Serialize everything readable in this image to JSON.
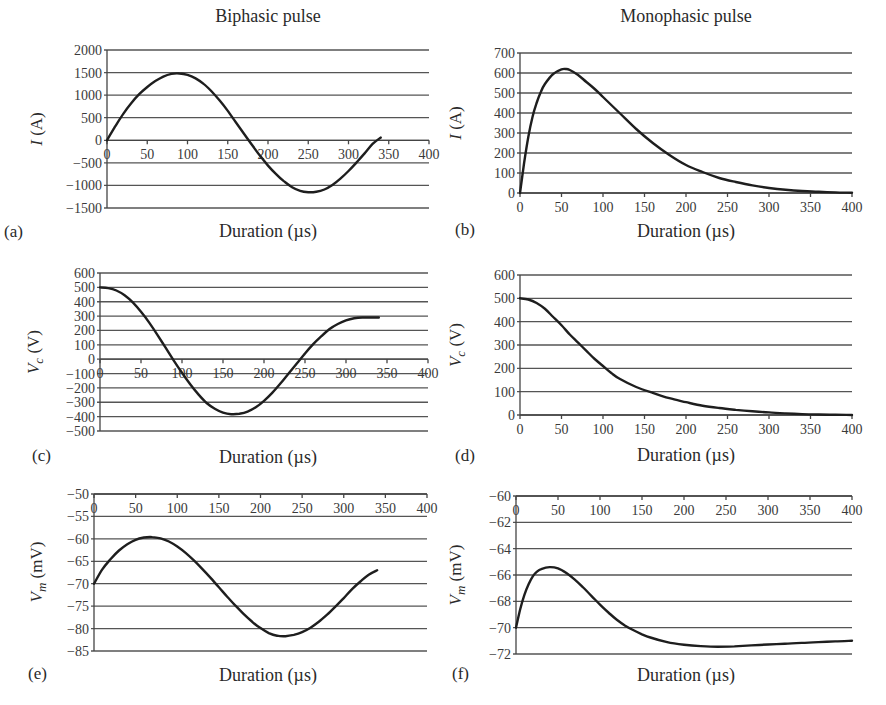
{
  "figure": {
    "column_titles": [
      "Biphasic pulse",
      "Monophasic pulse"
    ]
  },
  "chart_data": [
    {
      "id": "a",
      "panel_label": "(a)",
      "type": "line",
      "title": "Biphasic pulse",
      "xlabel": "Duration (µs)",
      "ylabel": "I (A)",
      "ylabel_parts": {
        "symbol": "I",
        "unit": "(A)",
        "subscript": ""
      },
      "xlim": [
        0,
        400
      ],
      "ylim": [
        -1500,
        2000
      ],
      "xticks": [
        0,
        50,
        100,
        150,
        200,
        250,
        300,
        350,
        400
      ],
      "yticks": [
        2000,
        1500,
        1000,
        500,
        0,
        -500,
        -1000,
        -1500
      ],
      "xtick_labels_at_y": 0,
      "grid": true,
      "legend": null,
      "series": [
        {
          "name": "I",
          "x": [
            0,
            10,
            20,
            30,
            40,
            50,
            60,
            70,
            80,
            90,
            100,
            110,
            120,
            130,
            140,
            150,
            160,
            170,
            180,
            190,
            200,
            210,
            220,
            230,
            240,
            250,
            260,
            270,
            280,
            290,
            300,
            310,
            320,
            330,
            340
          ],
          "values": [
            0,
            300,
            580,
            820,
            1020,
            1180,
            1310,
            1410,
            1470,
            1480,
            1450,
            1370,
            1250,
            1080,
            880,
            650,
            400,
            150,
            -100,
            -340,
            -560,
            -750,
            -910,
            -1040,
            -1120,
            -1150,
            -1140,
            -1090,
            -990,
            -850,
            -680,
            -490,
            -290,
            -80,
            60
          ]
        }
      ]
    },
    {
      "id": "b",
      "panel_label": "(b)",
      "type": "line",
      "title": "Monophasic pulse",
      "xlabel": "Duration (µs)",
      "ylabel": "I (A)",
      "ylabel_parts": {
        "symbol": "I",
        "unit": "(A)",
        "subscript": ""
      },
      "xlim": [
        0,
        400
      ],
      "ylim": [
        0,
        700
      ],
      "xticks": [
        0,
        50,
        100,
        150,
        200,
        250,
        300,
        350,
        400
      ],
      "yticks": [
        700,
        600,
        500,
        400,
        300,
        200,
        100,
        0
      ],
      "xtick_labels_at_y": 0,
      "grid": true,
      "legend": null,
      "series": [
        {
          "name": "I",
          "x": [
            0,
            5,
            10,
            15,
            20,
            25,
            30,
            40,
            50,
            55,
            60,
            70,
            80,
            90,
            100,
            120,
            140,
            160,
            180,
            200,
            220,
            240,
            260,
            280,
            300,
            320,
            340,
            360,
            380,
            400
          ],
          "values": [
            0,
            150,
            280,
            380,
            450,
            505,
            545,
            595,
            618,
            620,
            615,
            590,
            555,
            520,
            480,
            400,
            320,
            250,
            190,
            140,
            105,
            75,
            55,
            38,
            25,
            16,
            10,
            6,
            3,
            1
          ]
        }
      ]
    },
    {
      "id": "c",
      "panel_label": "(c)",
      "type": "line",
      "title": "",
      "xlabel": "Duration (µs)",
      "ylabel": "Vc (V)",
      "ylabel_parts": {
        "symbol": "V",
        "unit": "(V)",
        "subscript": "c"
      },
      "xlim": [
        0,
        400
      ],
      "ylim": [
        -500,
        600
      ],
      "xticks": [
        0,
        50,
        100,
        150,
        200,
        250,
        300,
        350,
        400
      ],
      "yticks": [
        600,
        500,
        400,
        300,
        200,
        100,
        0,
        -100,
        -200,
        -300,
        -400,
        -500
      ],
      "xtick_labels_at_y": 0,
      "grid": true,
      "legend": null,
      "series": [
        {
          "name": "Vc",
          "x": [
            0,
            10,
            20,
            30,
            40,
            50,
            60,
            70,
            80,
            90,
            100,
            110,
            120,
            130,
            140,
            150,
            160,
            170,
            180,
            190,
            200,
            210,
            220,
            230,
            240,
            250,
            260,
            270,
            280,
            290,
            300,
            310,
            320,
            330,
            340
          ],
          "values": [
            500,
            495,
            478,
            445,
            395,
            330,
            255,
            170,
            80,
            -10,
            -95,
            -175,
            -245,
            -305,
            -345,
            -372,
            -383,
            -380,
            -365,
            -335,
            -290,
            -235,
            -170,
            -100,
            -30,
            40,
            105,
            160,
            210,
            245,
            270,
            285,
            290,
            290,
            290
          ]
        }
      ]
    },
    {
      "id": "d",
      "panel_label": "(d)",
      "type": "line",
      "title": "",
      "xlabel": "Duration (µs)",
      "ylabel": "Vc (V)",
      "ylabel_parts": {
        "symbol": "V",
        "unit": "(V)",
        "subscript": "c"
      },
      "xlim": [
        0,
        400
      ],
      "ylim": [
        0,
        600
      ],
      "xticks": [
        0,
        50,
        100,
        150,
        200,
        250,
        300,
        350,
        400
      ],
      "yticks": [
        600,
        500,
        400,
        300,
        200,
        100,
        0
      ],
      "xtick_labels_at_y": 0,
      "grid": true,
      "legend": null,
      "series": [
        {
          "name": "Vc",
          "x": [
            0,
            10,
            20,
            30,
            40,
            50,
            60,
            70,
            80,
            90,
            100,
            110,
            120,
            140,
            160,
            180,
            200,
            220,
            240,
            260,
            280,
            300,
            320,
            340,
            360,
            380,
            400
          ],
          "values": [
            500,
            495,
            480,
            455,
            420,
            385,
            345,
            310,
            275,
            240,
            210,
            180,
            155,
            120,
            95,
            72,
            55,
            40,
            30,
            22,
            16,
            11,
            7,
            4,
            2,
            1,
            0
          ]
        }
      ]
    },
    {
      "id": "e",
      "panel_label": "(e)",
      "type": "line",
      "title": "",
      "xlabel": "Duration (µs)",
      "ylabel": "Vm (mV)",
      "ylabel_parts": {
        "symbol": "V",
        "unit": "(mV)",
        "subscript": "m"
      },
      "xlim": [
        0,
        400
      ],
      "ylim": [
        -85,
        -50
      ],
      "xticks": [
        0,
        50,
        100,
        150,
        200,
        250,
        300,
        350,
        400
      ],
      "yticks": [
        -50,
        -55,
        -60,
        -65,
        -70,
        -75,
        -80,
        -85
      ],
      "xtick_labels_at_y": -50,
      "grid": true,
      "legend": null,
      "series": [
        {
          "name": "Vm",
          "x": [
            0,
            10,
            20,
            30,
            40,
            50,
            60,
            70,
            80,
            90,
            100,
            110,
            120,
            130,
            140,
            150,
            160,
            170,
            180,
            190,
            200,
            210,
            220,
            230,
            240,
            250,
            260,
            270,
            280,
            290,
            300,
            310,
            320,
            330,
            340
          ],
          "values": [
            -70,
            -66.8,
            -64.5,
            -62.6,
            -61.2,
            -60.2,
            -59.7,
            -59.6,
            -59.9,
            -60.6,
            -61.7,
            -63.1,
            -64.8,
            -66.7,
            -68.7,
            -70.8,
            -72.9,
            -74.9,
            -76.8,
            -78.5,
            -79.9,
            -81,
            -81.6,
            -81.7,
            -81.4,
            -80.8,
            -79.8,
            -78.5,
            -76.9,
            -75.1,
            -73.2,
            -71.2,
            -69.5,
            -68,
            -67
          ]
        }
      ]
    },
    {
      "id": "f",
      "panel_label": "(f)",
      "type": "line",
      "title": "",
      "xlabel": "Duration (µs)",
      "ylabel": "Vm (mV)",
      "ylabel_parts": {
        "symbol": "V",
        "unit": "(mV)",
        "subscript": "m"
      },
      "xlim": [
        0,
        400
      ],
      "ylim": [
        -72,
        -60
      ],
      "xticks": [
        0,
        50,
        100,
        150,
        200,
        250,
        300,
        350,
        400
      ],
      "yticks": [
        -60,
        -62,
        -64,
        -66,
        -68,
        -70,
        -72
      ],
      "xtick_labels_at_y": -60,
      "grid": true,
      "legend": null,
      "series": [
        {
          "name": "Vm",
          "x": [
            0,
            5,
            10,
            15,
            20,
            25,
            30,
            40,
            50,
            60,
            70,
            80,
            90,
            100,
            110,
            120,
            130,
            140,
            150,
            160,
            180,
            200,
            220,
            240,
            260,
            280,
            300,
            320,
            340,
            360,
            380,
            400
          ],
          "values": [
            -70,
            -68.6,
            -67.5,
            -66.7,
            -66.1,
            -65.75,
            -65.55,
            -65.4,
            -65.5,
            -65.85,
            -66.35,
            -66.95,
            -67.6,
            -68.25,
            -68.85,
            -69.4,
            -69.85,
            -70.2,
            -70.5,
            -70.75,
            -71.1,
            -71.3,
            -71.4,
            -71.45,
            -71.42,
            -71.35,
            -71.28,
            -71.22,
            -71.16,
            -71.1,
            -71.04,
            -71.0
          ]
        }
      ]
    }
  ]
}
